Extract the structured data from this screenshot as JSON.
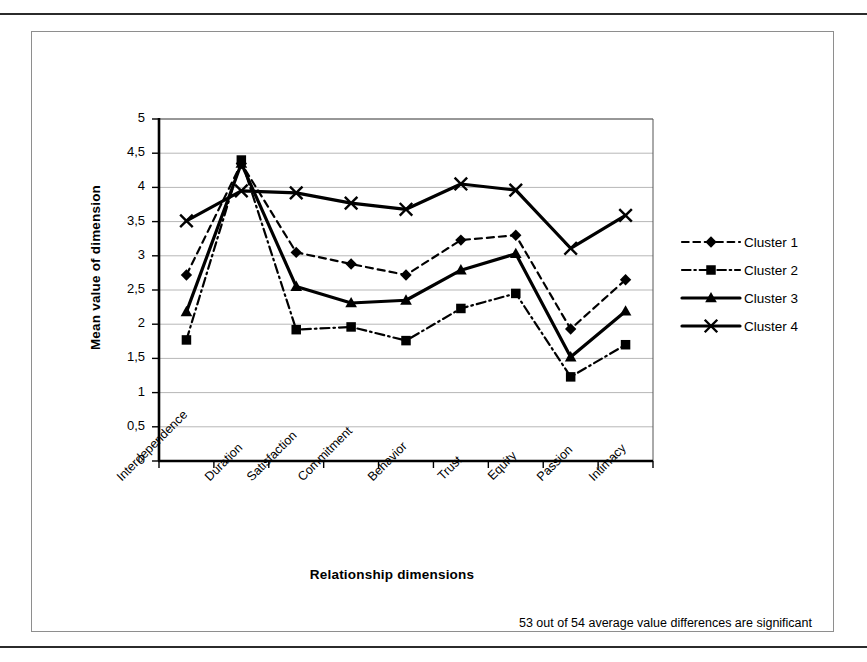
{
  "figure": {
    "caption": "53 out of 54 average value differences are significant"
  },
  "chart_data": {
    "type": "line",
    "title": "",
    "xlabel": "Relationship dimensions",
    "ylabel": "Mean value of dimension",
    "ylim": [
      0,
      5
    ],
    "grid": true,
    "legend_position": "right",
    "decimal_separator": ",",
    "ytick_labels": [
      "5",
      "4,5",
      "4",
      "3,5",
      "3",
      "2,5",
      "2",
      "1,5",
      "1",
      "0,5",
      "0"
    ],
    "ytick_values": [
      5,
      4.5,
      4,
      3.5,
      3,
      2.5,
      2,
      1.5,
      1,
      0.5,
      0
    ],
    "categories": [
      "Interdependence",
      "Duration",
      "Satisfaction",
      "Commitment",
      "Behavior",
      "Trust",
      "Equity",
      "Passion",
      "Intimacy"
    ],
    "series": [
      {
        "name": "Cluster 1",
        "marker": "diamond",
        "linestyle": "dashed",
        "color": "#000000",
        "values": [
          2.72,
          4.35,
          3.05,
          2.88,
          2.72,
          3.23,
          3.3,
          1.93,
          2.65
        ]
      },
      {
        "name": "Cluster 2",
        "marker": "square",
        "linestyle": "dashdot",
        "color": "#000000",
        "values": [
          1.77,
          4.4,
          1.92,
          1.96,
          1.76,
          2.23,
          2.45,
          1.23,
          1.7
        ]
      },
      {
        "name": "Cluster 3",
        "marker": "triangle",
        "linestyle": "solid",
        "color": "#000000",
        "values": [
          2.18,
          4.35,
          2.55,
          2.31,
          2.35,
          2.79,
          3.03,
          1.52,
          2.19
        ]
      },
      {
        "name": "Cluster 4",
        "marker": "cross",
        "linestyle": "solid",
        "color": "#000000",
        "values": [
          3.51,
          3.95,
          3.92,
          3.77,
          3.68,
          4.05,
          3.96,
          3.11,
          3.59
        ]
      }
    ]
  }
}
